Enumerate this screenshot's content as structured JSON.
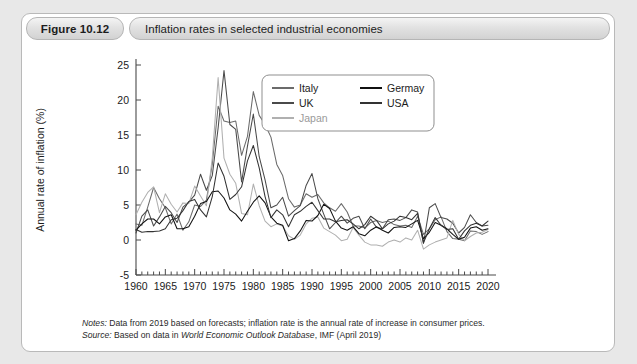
{
  "figure": {
    "number_label": "Figure 10.12",
    "title": "Inflation rates in selected industrial economies"
  },
  "notes": {
    "notes_key": "Notes:",
    "notes_text": " Data from 2019 based on forecasts; inflation rate is the annual rate of increase in consumer prices.",
    "source_key": "Source:",
    "source_pre": " Based on data in ",
    "source_em": "World Economic Outlook Database",
    "source_post": ", IMF (April 2019)"
  },
  "chart_data": {
    "type": "line",
    "title": "Inflation rates in selected industrial economies",
    "xlabel": "",
    "ylabel": "Annual rate of inflation (%)",
    "xlim": [
      1960,
      2020
    ],
    "ylim": [
      -5,
      25
    ],
    "ytick_step": 5,
    "yticks": [
      -5,
      0,
      5,
      10,
      15,
      20,
      25
    ],
    "xticks": [
      1960,
      1965,
      1970,
      1975,
      1980,
      1985,
      1990,
      1995,
      2000,
      2005,
      2010,
      2015,
      2020
    ],
    "xminor_step": 1,
    "grid": false,
    "legend_position": "top-right",
    "legend_columns": 2,
    "colors": {
      "Italy": "#6b6b6b",
      "UK": "#4a4a4a",
      "Japan": "#b0b0b0",
      "Germay": "#111111",
      "USA": "#333333"
    },
    "x": [
      1960,
      1961,
      1962,
      1963,
      1964,
      1965,
      1966,
      1967,
      1968,
      1969,
      1970,
      1971,
      1972,
      1973,
      1974,
      1975,
      1976,
      1977,
      1978,
      1979,
      1980,
      1981,
      1982,
      1983,
      1984,
      1985,
      1986,
      1987,
      1988,
      1989,
      1990,
      1991,
      1992,
      1993,
      1994,
      1995,
      1996,
      1997,
      1998,
      1999,
      2000,
      2001,
      2002,
      2003,
      2004,
      2005,
      2006,
      2007,
      2008,
      2009,
      2010,
      2011,
      2012,
      2013,
      2014,
      2015,
      2016,
      2017,
      2018,
      2019,
      2020
    ],
    "series": [
      {
        "name": "Italy",
        "values": [
          2.3,
          2.1,
          4.7,
          7.5,
          5.9,
          4.6,
          2.3,
          3.7,
          1.4,
          2.6,
          5.0,
          4.8,
          5.7,
          10.8,
          19.1,
          17.0,
          16.8,
          17.0,
          12.1,
          14.8,
          21.2,
          17.8,
          16.5,
          14.7,
          10.8,
          9.2,
          5.9,
          4.7,
          5.0,
          6.6,
          6.1,
          6.5,
          5.3,
          4.6,
          4.1,
          5.2,
          4.0,
          2.0,
          2.0,
          1.7,
          2.5,
          2.8,
          2.5,
          2.7,
          2.2,
          2.0,
          2.1,
          1.8,
          3.4,
          0.8,
          1.6,
          2.9,
          3.3,
          1.2,
          0.2,
          0.1,
          -0.1,
          1.3,
          1.2,
          0.8,
          1.2
        ]
      },
      {
        "name": "UK",
        "values": [
          1.0,
          3.4,
          4.3,
          2.0,
          3.3,
          4.8,
          3.9,
          2.5,
          4.7,
          5.4,
          6.4,
          9.4,
          7.1,
          9.2,
          16.0,
          24.2,
          16.5,
          15.8,
          8.3,
          13.4,
          18.0,
          11.9,
          8.6,
          4.6,
          5.0,
          6.1,
          3.4,
          4.2,
          4.9,
          7.8,
          9.5,
          5.9,
          3.7,
          1.6,
          2.5,
          3.4,
          2.4,
          3.1,
          3.4,
          1.6,
          3.0,
          1.8,
          1.6,
          2.9,
          3.0,
          2.8,
          3.2,
          4.3,
          4.0,
          -0.5,
          4.6,
          5.2,
          3.2,
          3.0,
          2.4,
          1.0,
          1.8,
          3.6,
          2.5,
          2.0,
          2.1
        ]
      },
      {
        "name": "Japan",
        "values": [
          3.6,
          5.4,
          6.8,
          7.6,
          3.9,
          6.6,
          5.1,
          4.0,
          5.3,
          5.2,
          7.7,
          6.3,
          4.9,
          11.7,
          23.2,
          11.7,
          9.4,
          8.1,
          3.8,
          3.6,
          8.0,
          4.9,
          2.7,
          1.9,
          2.3,
          2.0,
          0.6,
          0.1,
          0.7,
          2.3,
          3.1,
          3.3,
          1.7,
          1.2,
          0.7,
          -0.1,
          0.1,
          1.8,
          0.7,
          -0.3,
          -0.7,
          -0.7,
          -0.9,
          -0.3,
          0.0,
          -0.3,
          0.3,
          0.0,
          1.4,
          -1.3,
          -0.7,
          -0.3,
          0.0,
          0.3,
          2.8,
          0.8,
          -0.1,
          0.5,
          1.0,
          1.1,
          1.5
        ]
      },
      {
        "name": "Germay",
        "values": [
          1.4,
          2.3,
          3.0,
          3.0,
          2.3,
          3.3,
          3.6,
          1.6,
          1.6,
          1.9,
          3.4,
          5.2,
          5.5,
          6.9,
          7.0,
          6.0,
          4.3,
          3.7,
          2.7,
          4.1,
          5.4,
          6.3,
          5.3,
          3.3,
          2.4,
          2.1,
          -0.1,
          0.2,
          1.3,
          2.8,
          2.7,
          3.5,
          5.1,
          4.5,
          2.7,
          1.7,
          1.4,
          1.9,
          0.9,
          0.6,
          1.4,
          1.9,
          1.4,
          1.0,
          1.8,
          1.9,
          1.8,
          2.3,
          2.8,
          0.2,
          1.1,
          2.5,
          2.1,
          1.6,
          0.8,
          0.1,
          0.4,
          1.7,
          1.9,
          1.4,
          1.6
        ]
      },
      {
        "name": "USA",
        "values": [
          1.5,
          1.1,
          1.2,
          1.2,
          1.3,
          1.6,
          2.9,
          3.1,
          4.2,
          5.5,
          5.8,
          4.3,
          3.3,
          6.2,
          11.0,
          9.1,
          5.8,
          6.5,
          7.6,
          11.3,
          13.5,
          10.3,
          6.2,
          3.2,
          4.3,
          3.6,
          1.9,
          3.6,
          4.1,
          4.8,
          5.4,
          4.2,
          3.0,
          3.0,
          2.6,
          2.8,
          2.9,
          2.3,
          1.6,
          2.2,
          3.4,
          2.8,
          1.6,
          2.3,
          2.7,
          3.4,
          3.2,
          2.9,
          3.8,
          -0.4,
          1.6,
          3.2,
          2.1,
          1.5,
          1.6,
          0.1,
          1.3,
          2.1,
          2.4,
          2.0,
          2.7
        ]
      }
    ]
  }
}
